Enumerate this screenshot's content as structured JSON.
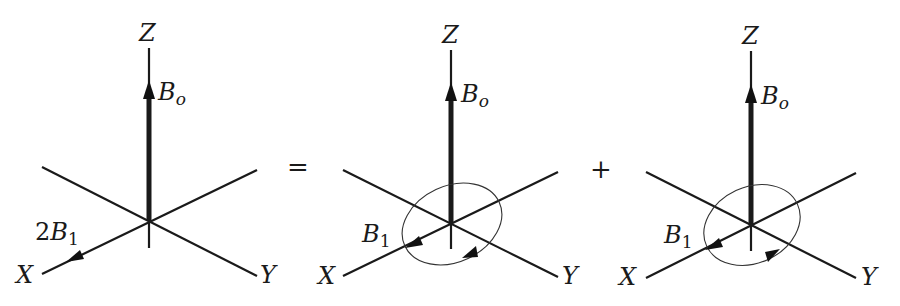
{
  "diagram": {
    "operators": {
      "equals": "=",
      "plus": "+"
    },
    "panels": [
      {
        "id": "linear",
        "axis_labels": {
          "z": "Z",
          "x": "X",
          "y": "Y"
        },
        "static_field": {
          "symbol": "B",
          "subscript": "o"
        },
        "rf_field": {
          "prefix": "2",
          "symbol": "B",
          "subscript": "1"
        },
        "rotation": "none"
      },
      {
        "id": "rotating-1",
        "axis_labels": {
          "z": "Z",
          "x": "X",
          "y": "Y"
        },
        "static_field": {
          "symbol": "B",
          "subscript": "o"
        },
        "rf_field": {
          "prefix": "",
          "symbol": "B",
          "subscript": "1"
        },
        "rotation": "clockwise (viewed from above)"
      },
      {
        "id": "rotating-2",
        "axis_labels": {
          "z": "Z",
          "x": "X",
          "y": "Y"
        },
        "static_field": {
          "symbol": "B",
          "subscript": "o"
        },
        "rf_field": {
          "prefix": "",
          "symbol": "B",
          "subscript": "1"
        },
        "rotation": "counter-clockwise (viewed from above)"
      }
    ]
  }
}
